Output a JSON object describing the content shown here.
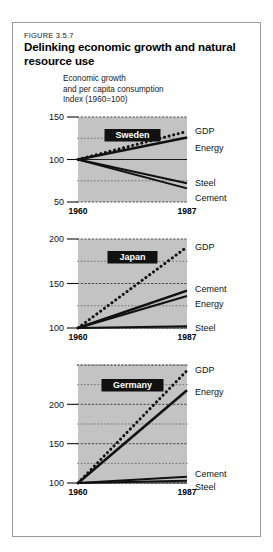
{
  "figure": {
    "number": "FIGURE 3.5.7",
    "title": "Delinking economic growth and natural resource use",
    "subtitle_line1": "Economic growth",
    "subtitle_line2": "and per capita consumption",
    "index_note": "Index (1960=100)"
  },
  "colors": {
    "plot_background": "#c3c3c3",
    "line": "#111111",
    "frame_border": "#9a9a9a",
    "country_badge_bg": "#111111",
    "country_badge_text": "#ffffff",
    "page_background": "#ffffff"
  },
  "chart_data": [
    {
      "type": "line",
      "title": "Sweden",
      "xlabel": "",
      "ylabel": "Index (1960=100)",
      "x": [
        1960,
        1987
      ],
      "xlim": [
        1960,
        1987
      ],
      "xticks": [
        1960,
        1987
      ],
      "xticklabels": [
        "1960",
        "1987"
      ],
      "ylim": [
        50,
        150
      ],
      "yticks": [
        50,
        100,
        150
      ],
      "yticklabels": [
        "50",
        "100",
        "150"
      ],
      "minor_gridlines": [
        75,
        125
      ],
      "grid": true,
      "legend": "right-of-axes",
      "series": [
        {
          "name": "GDP",
          "style": "dotted",
          "values": [
            100,
            133
          ]
        },
        {
          "name": "Energy",
          "style": "solid",
          "values": [
            100,
            126
          ]
        },
        {
          "name": "Steel",
          "style": "solid",
          "values": [
            100,
            72
          ]
        },
        {
          "name": "Cement",
          "style": "solid",
          "values": [
            100,
            66
          ]
        }
      ]
    },
    {
      "type": "line",
      "title": "Japan",
      "xlabel": "",
      "ylabel": "Index (1960=100)",
      "x": [
        1960,
        1987
      ],
      "xlim": [
        1960,
        1987
      ],
      "xticks": [
        1960,
        1987
      ],
      "xticklabels": [
        "1960",
        "1987"
      ],
      "ylim": [
        100,
        200
      ],
      "yticks": [
        100,
        150,
        200
      ],
      "yticklabels": [
        "100",
        "150",
        "200"
      ],
      "minor_gridlines": [
        125,
        175
      ],
      "grid": true,
      "legend": "right-of-axes",
      "series": [
        {
          "name": "GDP",
          "style": "dotted",
          "values": [
            100,
            191
          ]
        },
        {
          "name": "Cement",
          "style": "solid",
          "values": [
            100,
            142
          ]
        },
        {
          "name": "Energy",
          "style": "solid",
          "values": [
            100,
            136
          ]
        },
        {
          "name": "Steel",
          "style": "solid",
          "values": [
            100,
            102
          ]
        }
      ]
    },
    {
      "type": "line",
      "title": "Germany",
      "xlabel": "",
      "ylabel": "Index (1960=100)",
      "x": [
        1960,
        1987
      ],
      "xlim": [
        1960,
        1987
      ],
      "xticks": [
        1960,
        1987
      ],
      "xticklabels": [
        "1960",
        "1987"
      ],
      "ylim": [
        100,
        250
      ],
      "yticks": [
        100,
        150,
        200
      ],
      "yticklabels": [
        "100",
        "150",
        "200"
      ],
      "minor_gridlines": [
        125,
        175,
        225,
        250
      ],
      "grid": true,
      "legend": "right-of-axes",
      "series": [
        {
          "name": "GDP",
          "style": "dotted",
          "values": [
            100,
            243
          ]
        },
        {
          "name": "Energy",
          "style": "solid",
          "values": [
            100,
            218
          ]
        },
        {
          "name": "Cement",
          "style": "solid",
          "values": [
            100,
            108
          ]
        },
        {
          "name": "Steel",
          "style": "solid",
          "values": [
            100,
            103
          ]
        }
      ]
    }
  ]
}
